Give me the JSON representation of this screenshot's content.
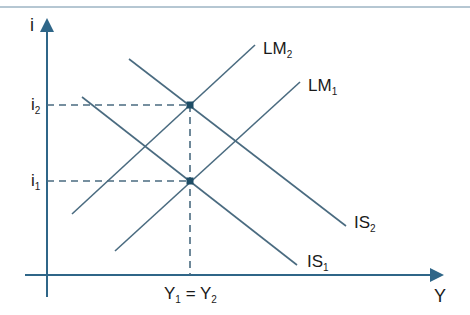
{
  "diagram": {
    "colors": {
      "line": "#4a6b80",
      "axis": "#2f6688",
      "point": "#1e4d66",
      "rule": "#6c8fa6",
      "text": "#1a1a1a"
    },
    "axes": {
      "y_label": "i",
      "x_label": "Y"
    },
    "curves": [
      {
        "name": "LM2",
        "label": "LM",
        "sub": "2",
        "from": [
          72,
          214
        ],
        "to": [
          255,
          45
        ]
      },
      {
        "name": "LM1",
        "label": "LM",
        "sub": "1",
        "from": [
          115,
          251
        ],
        "to": [
          300,
          82
        ]
      },
      {
        "name": "IS2",
        "label": "IS",
        "sub": "2",
        "from": [
          129,
          59
        ],
        "to": [
          346,
          226
        ]
      },
      {
        "name": "IS1",
        "label": "IS",
        "sub": "1",
        "from": [
          82,
          97
        ],
        "to": [
          297,
          265
        ]
      }
    ],
    "levels": {
      "i2": {
        "label": "i",
        "sub": "2"
      },
      "i1": {
        "label": "i",
        "sub": "1"
      },
      "y_eq": {
        "left": "Y",
        "left_sub": "1",
        "eq": "=",
        "right": "Y",
        "right_sub": "2"
      }
    },
    "equilibria": [
      {
        "name": "E2",
        "x": 190,
        "y": 105
      },
      {
        "name": "E1",
        "x": 190,
        "y": 181
      }
    ]
  }
}
